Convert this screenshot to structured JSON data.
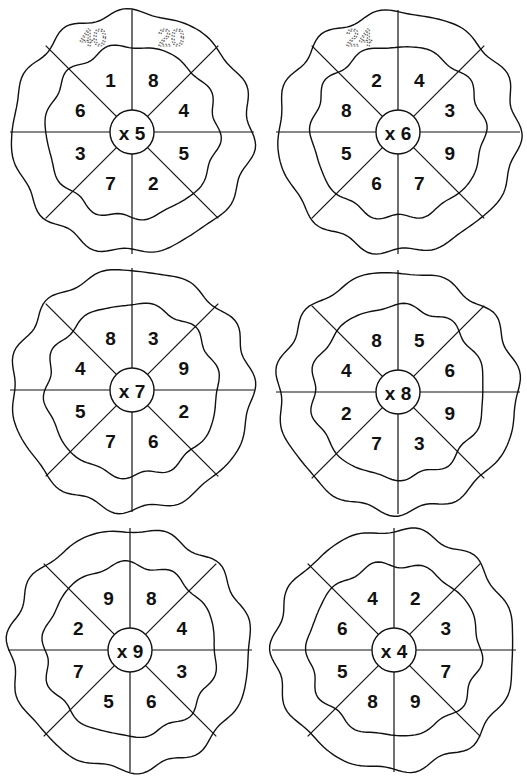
{
  "worksheet": {
    "wheels": [
      {
        "multiplier_label": "x 5",
        "multiplier": 5,
        "inner_numbers": [
          "8",
          "4",
          "5",
          "2",
          "7",
          "3",
          "6",
          "1"
        ],
        "outer_answers": [
          "20",
          "",
          "",
          "",
          "",
          "",
          "",
          "40"
        ]
      },
      {
        "multiplier_label": "x 6",
        "multiplier": 6,
        "inner_numbers": [
          "4",
          "3",
          "9",
          "7",
          "6",
          "5",
          "8",
          "2"
        ],
        "outer_answers": [
          "",
          "",
          "",
          "",
          "",
          "",
          "",
          "24"
        ]
      },
      {
        "multiplier_label": "x 7",
        "multiplier": 7,
        "inner_numbers": [
          "3",
          "9",
          "2",
          "6",
          "7",
          "5",
          "4",
          "8"
        ],
        "outer_answers": [
          "",
          "",
          "",
          "",
          "",
          "",
          "",
          ""
        ]
      },
      {
        "multiplier_label": "x 8",
        "multiplier": 8,
        "inner_numbers": [
          "5",
          "6",
          "9",
          "3",
          "7",
          "2",
          "4",
          "8"
        ],
        "outer_answers": [
          "",
          "",
          "",
          "",
          "",
          "",
          "",
          ""
        ]
      },
      {
        "multiplier_label": "x 9",
        "multiplier": 9,
        "inner_numbers": [
          "8",
          "4",
          "3",
          "6",
          "5",
          "7",
          "2",
          "9"
        ],
        "outer_answers": [
          "",
          "",
          "",
          "",
          "",
          "",
          "",
          ""
        ]
      },
      {
        "multiplier_label": "x 4",
        "multiplier": 4,
        "inner_numbers": [
          "2",
          "3",
          "7",
          "9",
          "8",
          "5",
          "6",
          "4"
        ],
        "outer_answers": [
          "",
          "",
          "",
          "",
          "",
          "",
          "",
          ""
        ]
      }
    ]
  }
}
